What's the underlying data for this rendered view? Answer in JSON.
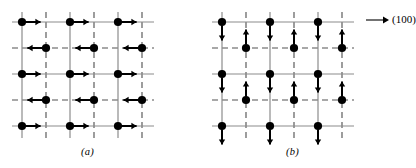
{
  "figure": {
    "background_color": "#ffffff",
    "grid_line_color": "#8c8c8c",
    "dot_color": "#000000",
    "arrow_color": "#000000",
    "direction_label": "(100)",
    "direction_arrow_icon": "right-arrow-icon"
  },
  "panels": [
    {
      "id": "a",
      "caption": "(a)",
      "spin_axis": "horizontal",
      "description": "Spins lie in the plane along the (100) direction; rows alternate right and left pointing spins",
      "grid": {
        "columns": 6,
        "rows": 5,
        "column_styles": [
          "solid",
          "dashed",
          "solid",
          "dashed",
          "solid",
          "dashed"
        ],
        "row_styles": [
          "solid",
          "dashed",
          "solid",
          "dashed",
          "solid"
        ],
        "x0": 22,
        "dx": 24,
        "y0": 22,
        "dy": 26
      },
      "spins": [
        {
          "row": 1,
          "col": 1,
          "dir": "right"
        },
        {
          "row": 1,
          "col": 3,
          "dir": "right"
        },
        {
          "row": 1,
          "col": 5,
          "dir": "right"
        },
        {
          "row": 2,
          "col": 2,
          "dir": "left"
        },
        {
          "row": 2,
          "col": 4,
          "dir": "left"
        },
        {
          "row": 2,
          "col": 6,
          "dir": "left"
        },
        {
          "row": 3,
          "col": 1,
          "dir": "right"
        },
        {
          "row": 3,
          "col": 3,
          "dir": "right"
        },
        {
          "row": 3,
          "col": 5,
          "dir": "right"
        },
        {
          "row": 4,
          "col": 2,
          "dir": "left"
        },
        {
          "row": 4,
          "col": 4,
          "dir": "left"
        },
        {
          "row": 4,
          "col": 6,
          "dir": "left"
        },
        {
          "row": 5,
          "col": 1,
          "dir": "right"
        },
        {
          "row": 5,
          "col": 3,
          "dir": "right"
        },
        {
          "row": 5,
          "col": 5,
          "dir": "right"
        }
      ]
    },
    {
      "id": "b",
      "caption": "(b)",
      "spin_axis": "vertical",
      "description": "Spins lie in the plane perpendicular to the (100) direction; rows alternate down and up pointing spins",
      "grid": {
        "columns": 6,
        "rows": 5,
        "column_styles": [
          "solid",
          "dashed",
          "solid",
          "dashed",
          "solid",
          "dashed"
        ],
        "row_styles": [
          "solid",
          "dashed",
          "solid",
          "dashed",
          "solid"
        ],
        "x0": 22,
        "dx": 24,
        "y0": 22,
        "dy": 26
      },
      "spins": [
        {
          "row": 1,
          "col": 1,
          "dir": "down"
        },
        {
          "row": 1,
          "col": 3,
          "dir": "down"
        },
        {
          "row": 1,
          "col": 5,
          "dir": "down"
        },
        {
          "row": 2,
          "col": 2,
          "dir": "up"
        },
        {
          "row": 2,
          "col": 4,
          "dir": "up"
        },
        {
          "row": 2,
          "col": 6,
          "dir": "up"
        },
        {
          "row": 3,
          "col": 1,
          "dir": "down"
        },
        {
          "row": 3,
          "col": 3,
          "dir": "down"
        },
        {
          "row": 3,
          "col": 5,
          "dir": "down"
        },
        {
          "row": 4,
          "col": 2,
          "dir": "up"
        },
        {
          "row": 4,
          "col": 4,
          "dir": "up"
        },
        {
          "row": 4,
          "col": 6,
          "dir": "up"
        },
        {
          "row": 5,
          "col": 1,
          "dir": "down"
        },
        {
          "row": 5,
          "col": 3,
          "dir": "down"
        },
        {
          "row": 5,
          "col": 5,
          "dir": "down"
        }
      ]
    }
  ]
}
